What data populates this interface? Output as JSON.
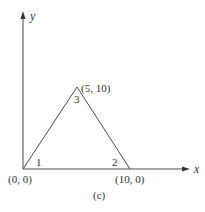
{
  "figure": {
    "caption": "(c)",
    "axes": {
      "x_label": "x",
      "y_label": "y"
    },
    "vertices": [
      {
        "id": "1",
        "coord_label": "(0, 0)",
        "node_label": "1"
      },
      {
        "id": "2",
        "coord_label": "(10, 0)",
        "node_label": "2"
      },
      {
        "id": "3",
        "coord_label": "(5, 10)",
        "node_label": "3"
      }
    ],
    "colors": {
      "line": "#4a4a4a",
      "text": "#333333",
      "background": "#ffffff"
    }
  }
}
